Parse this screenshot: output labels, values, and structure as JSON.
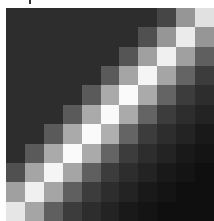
{
  "chart_data": {
    "type": "heatmap",
    "title": "",
    "xlabel": "",
    "ylabel": "",
    "colormap": "grayscale",
    "rows": 11,
    "cols": 11,
    "legend": "none",
    "grid": false,
    "values": [
      [
        45,
        45,
        45,
        45,
        45,
        45,
        45,
        45,
        70,
        150,
        225
      ],
      [
        45,
        45,
        45,
        45,
        45,
        45,
        45,
        80,
        150,
        235,
        150
      ],
      [
        45,
        45,
        45,
        45,
        45,
        45,
        85,
        160,
        240,
        160,
        95
      ],
      [
        45,
        45,
        45,
        45,
        45,
        90,
        165,
        245,
        165,
        100,
        60
      ],
      [
        45,
        45,
        45,
        45,
        90,
        170,
        250,
        170,
        100,
        60,
        45
      ],
      [
        45,
        45,
        45,
        90,
        170,
        250,
        170,
        100,
        60,
        45,
        35
      ],
      [
        45,
        45,
        90,
        170,
        250,
        175,
        100,
        60,
        45,
        35,
        25
      ],
      [
        45,
        90,
        170,
        250,
        170,
        100,
        60,
        45,
        35,
        25,
        20
      ],
      [
        80,
        165,
        245,
        165,
        95,
        60,
        45,
        35,
        25,
        20,
        15
      ],
      [
        160,
        240,
        165,
        95,
        60,
        45,
        35,
        25,
        20,
        15,
        15
      ],
      [
        230,
        165,
        95,
        60,
        45,
        35,
        25,
        20,
        15,
        15,
        15
      ]
    ]
  }
}
